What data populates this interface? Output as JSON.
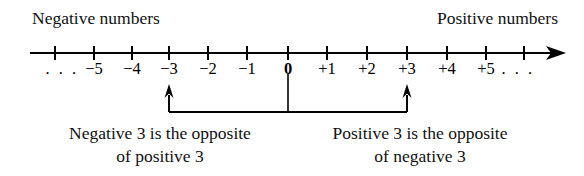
{
  "figure": {
    "title_left": "Negative numbers",
    "title_right": "Positive numbers",
    "background_color": "#ffffff",
    "ink_color": "#000000"
  },
  "number_line": {
    "left_ellipsis": ". . .",
    "right_ellipsis": ". . .",
    "zero_label": "0",
    "ticks": [
      {
        "value": -6,
        "label": "",
        "x": 55
      },
      {
        "value": -5,
        "label": "−5",
        "x": 94
      },
      {
        "value": -4,
        "label": "−4",
        "x": 132
      },
      {
        "value": -3,
        "label": "−3",
        "x": 169
      },
      {
        "value": -2,
        "label": "−2",
        "x": 208
      },
      {
        "value": -1,
        "label": "−1",
        "x": 247
      },
      {
        "value": 0,
        "label": "0",
        "x": 288
      },
      {
        "value": 1,
        "label": "+1",
        "x": 327
      },
      {
        "value": 2,
        "label": "+2",
        "x": 367
      },
      {
        "value": 3,
        "label": "+3",
        "x": 407
      },
      {
        "value": 4,
        "label": "+4",
        "x": 447
      },
      {
        "value": 5,
        "label": "+5",
        "x": 486
      },
      {
        "value": 6,
        "label": "",
        "x": 524
      }
    ],
    "left_ellipsis_x": 62,
    "right_ellipsis_x": 518,
    "arrow_direction": "right"
  },
  "bracket": {
    "left_arrow_value": -3,
    "right_arrow_value": 3,
    "origin_value": 0,
    "arrow_direction": "up"
  },
  "captions": {
    "left": {
      "line1": "Negative 3 is the opposite",
      "line2": "of positive 3",
      "center_x": 160
    },
    "right": {
      "line1": "Positive 3 is the opposite",
      "line2": "of negative 3",
      "center_x": 420
    }
  },
  "chart_data": {
    "type": "line",
    "xlabel": "",
    "ylabel": "",
    "xlim": [
      -6,
      6
    ],
    "grid": false,
    "legend": "none",
    "categories": [
      "−5",
      "−4",
      "−3",
      "−2",
      "−1",
      "0",
      "+1",
      "+2",
      "+3",
      "+4",
      "+5"
    ],
    "values": [
      -5,
      -4,
      -3,
      -2,
      -1,
      0,
      1,
      2,
      3,
      4,
      5
    ],
    "annotations": [
      "Negative numbers",
      "Positive numbers",
      "Negative 3 is the opposite of positive 3",
      "Positive 3 is the opposite of negative 3"
    ]
  }
}
